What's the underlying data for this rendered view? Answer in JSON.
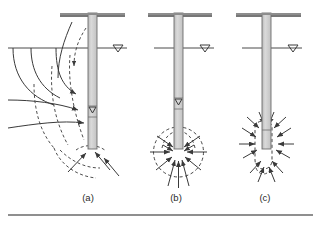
{
  "figure": {
    "name": "pile-seepage-diagram",
    "background": "#ffffff",
    "colors": {
      "line": "#3a3a3a",
      "pile_fill": "#cfcfcf",
      "pile_stroke": "#6e6e6e",
      "dashed": "#4a4a4a",
      "rule": "#6a6a6a",
      "caption": "#2a2a2a"
    },
    "rule": {
      "name": "bottom-rule",
      "y": 215,
      "x1": 8,
      "x2": 313
    },
    "panels": [
      {
        "id": "a",
        "caption": "(a)",
        "caption_x": 88,
        "caption_y": 201,
        "pile": {
          "x": 88,
          "y": 13,
          "width": 9,
          "height": 136
        },
        "ground_line": {
          "y": 16,
          "x1": 60,
          "x2": 125
        },
        "water_table": {
          "y": 48,
          "x1": 97,
          "x2": 127,
          "symbol": "water-table-triangle",
          "tri_x": 118,
          "tri_y": 45
        },
        "inner_water_marker": {
          "x": 89,
          "y": 110,
          "symbol": "water-level-triangle"
        },
        "seepage_style": "flow-net-one-sided",
        "description": "Flow net with equipotential arcs and dashed streamlines converging on pile shaft and tip from one side"
      },
      {
        "id": "b",
        "caption": "(b)",
        "caption_x": 176,
        "caption_y": 201,
        "pile": {
          "x": 174,
          "y": 13,
          "width": 9,
          "height": 136
        },
        "ground_line": {
          "y": 16,
          "x1": 148,
          "x2": 212
        },
        "water_table": {
          "y": 48,
          "x1": 183,
          "x2": 214,
          "symbol": "water-table-triangle",
          "tri_x": 205,
          "tri_y": 45
        },
        "inner_water_marker": {
          "x": 175,
          "y": 101,
          "symbol": "water-level-triangle"
        },
        "seepage_style": "radial-tip-circle",
        "description": "Dashed circle around pile tip with arrows converging radially into the toe"
      },
      {
        "id": "c",
        "caption": "(c)",
        "caption_x": 265,
        "caption_y": 201,
        "pile": {
          "x": 262,
          "y": 13,
          "width": 9,
          "height": 136
        },
        "ground_line": {
          "y": 16,
          "x1": 236,
          "x2": 301
        },
        "water_table": {
          "y": 48,
          "x1": 271,
          "x2": 302,
          "symbol": "water-table-triangle",
          "tri_x": 293,
          "tri_y": 45
        },
        "inner_water_marker": null,
        "seepage_style": "capsule-around-toe",
        "description": "Dashed capsule around lower pile length with arrows converging inward along the whole embedded toe"
      }
    ]
  }
}
